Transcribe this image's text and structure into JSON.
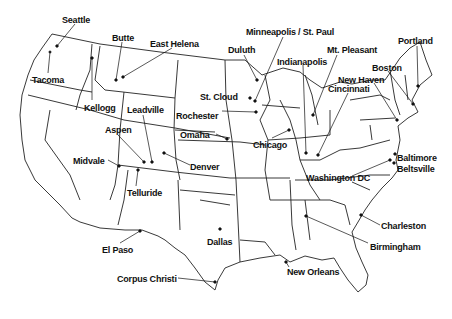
{
  "map": {
    "title": "",
    "cities": [
      {
        "name": "Seattle",
        "dot": [
          57,
          46
        ],
        "label": [
          62,
          15
        ]
      },
      {
        "name": "Tacoma",
        "dot": [
          50,
          52
        ],
        "label": [
          32,
          75
        ]
      },
      {
        "name": "Butte",
        "dot": [
          116,
          80
        ],
        "label": [
          112,
          33
        ]
      },
      {
        "name": "East Helena",
        "dot": [
          123,
          77
        ],
        "label": [
          150,
          39
        ]
      },
      {
        "name": "Kellogg",
        "dot": [
          92,
          58
        ],
        "label": [
          84,
          103
        ]
      },
      {
        "name": "Leadville",
        "dot": [
          152,
          162
        ],
        "label": [
          127,
          105
        ]
      },
      {
        "name": "Aspen",
        "dot": [
          144,
          162
        ],
        "label": [
          105,
          125
        ]
      },
      {
        "name": "Midvale",
        "dot": [
          119,
          166
        ],
        "label": [
          73,
          156
        ]
      },
      {
        "name": "Denver",
        "dot": [
          164,
          153
        ],
        "label": [
          190,
          162
        ]
      },
      {
        "name": "Telluride",
        "dot": [
          138,
          170
        ],
        "label": [
          127,
          188
        ]
      },
      {
        "name": "El Paso",
        "dot": [
          140,
          231
        ],
        "label": [
          102,
          245
        ]
      },
      {
        "name": "Corpus Christi",
        "dot": [
          215,
          282
        ],
        "label": [
          117,
          274
        ]
      },
      {
        "name": "Dallas",
        "dot": [
          220,
          229
        ],
        "label": [
          207,
          237
        ]
      },
      {
        "name": "Omaha",
        "dot": [
          227,
          139
        ],
        "label": [
          180,
          130
        ]
      },
      {
        "name": "Rochester",
        "dot": [
          256,
          112
        ],
        "label": [
          176,
          111
        ]
      },
      {
        "name": "St. Cloud",
        "dot": [
          250,
          98
        ],
        "label": [
          200,
          92
        ]
      },
      {
        "name": "Duluth",
        "dot": [
          257,
          80
        ],
        "label": [
          228,
          45
        ]
      },
      {
        "name": "Minneapolis / St. Paul",
        "dot": [
          255,
          101
        ],
        "label": [
          246,
          27
        ]
      },
      {
        "name": "Indianapolis",
        "dot": [
          306,
          153
        ],
        "label": [
          277,
          57
        ]
      },
      {
        "name": "Chicago",
        "dot": [
          289,
          130
        ],
        "label": [
          253,
          140
        ]
      },
      {
        "name": "Mt. Pleasant",
        "dot": [
          313,
          115
        ],
        "label": [
          327,
          45
        ]
      },
      {
        "name": "Cincinnati",
        "dot": [
          318,
          155
        ],
        "label": [
          328,
          84
        ]
      },
      {
        "name": "New Haven",
        "dot": [
          397,
          120
        ],
        "label": [
          338,
          75
        ]
      },
      {
        "name": "Boston",
        "dot": [
          413,
          104
        ],
        "label": [
          372,
          63
        ]
      },
      {
        "name": "Portland",
        "dot": [
          418,
          86
        ],
        "label": [
          398,
          36
        ]
      },
      {
        "name": "Baltimore",
        "dot": [
          395,
          154
        ],
        "label": [
          397,
          153
        ]
      },
      {
        "name": "Beltsville",
        "dot": [
          394,
          163
        ],
        "label": [
          397,
          164
        ]
      },
      {
        "name": "Washington DC",
        "dot": [
          390,
          160
        ],
        "label": [
          306,
          173
        ]
      },
      {
        "name": "Charleston",
        "dot": [
          361,
          215
        ],
        "label": [
          381,
          221
        ]
      },
      {
        "name": "Birmingham",
        "dot": [
          306,
          216
        ],
        "label": [
          370,
          242
        ]
      },
      {
        "name": "New Orleans",
        "dot": [
          286,
          262
        ],
        "label": [
          287,
          267
        ]
      }
    ],
    "colors": {
      "ink": "#111111",
      "background": "#ffffff"
    }
  }
}
